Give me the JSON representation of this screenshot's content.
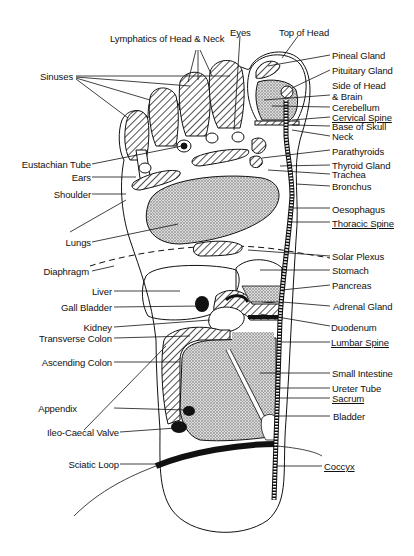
{
  "diagram": {
    "labels_top": [
      {
        "key": "lymphatics",
        "text": "Lymphatics of Head & Neck",
        "x": 110,
        "y": 33
      },
      {
        "key": "eyes",
        "text": "Eyes",
        "x": 230,
        "y": 27
      },
      {
        "key": "top_of_head",
        "text": "Top of Head",
        "x": 279,
        "y": 27
      },
      {
        "key": "sinuses",
        "text": "Sinuses",
        "x": 40,
        "y": 71
      }
    ],
    "labels_left": [
      {
        "key": "eustachian_tube",
        "text": "Eustachian Tube",
        "x": 91,
        "y": 159
      },
      {
        "key": "ears",
        "text": "Ears",
        "x": 91,
        "y": 172
      },
      {
        "key": "shoulder",
        "text": "Shoulder",
        "x": 91,
        "y": 189
      },
      {
        "key": "lungs",
        "text": "Lungs",
        "x": 91,
        "y": 237
      },
      {
        "key": "diaphragm",
        "text": "Diaphragm",
        "x": 89,
        "y": 266
      },
      {
        "key": "liver",
        "text": "Liver",
        "x": 112,
        "y": 286
      },
      {
        "key": "gall_bladder",
        "text": "Gall Bladder",
        "x": 112,
        "y": 302
      },
      {
        "key": "kidney",
        "text": "Kidney",
        "x": 112,
        "y": 322
      },
      {
        "key": "transverse_colon",
        "text": "Transverse Colon",
        "x": 112,
        "y": 333
      },
      {
        "key": "ascending_colon",
        "text": "Ascending Colon",
        "x": 112,
        "y": 357
      },
      {
        "key": "appendix",
        "text": "Appendix",
        "x": 77,
        "y": 404
      },
      {
        "key": "ileo_caecal_valve",
        "text": "Ileo-Caecal Valve",
        "x": 119,
        "y": 428
      },
      {
        "key": "sciatic_loop",
        "text": "Sciatic Loop",
        "x": 119,
        "y": 460
      }
    ],
    "labels_right": [
      {
        "key": "pineal_gland",
        "text": "Pineal Gland",
        "x": 332,
        "y": 50,
        "underline": false
      },
      {
        "key": "pituitary_gland",
        "text": "Pituitary Gland",
        "x": 332,
        "y": 65,
        "underline": false
      },
      {
        "key": "side_of_head",
        "text": "Side of Head",
        "x": 332,
        "y": 80,
        "underline": false
      },
      {
        "key": "and_brain",
        "text": "& Brain",
        "x": 332,
        "y": 91,
        "underline": false
      },
      {
        "key": "cerebellum",
        "text": "Cerebellum",
        "x": 332,
        "y": 102,
        "underline": false
      },
      {
        "key": "cervical_spine",
        "text": "Cervical Spine",
        "x": 332,
        "y": 113,
        "underline": true
      },
      {
        "key": "base_of_skull",
        "text": "Base of Skull",
        "x": 332,
        "y": 122,
        "underline": false
      },
      {
        "key": "neck",
        "text": "Neck",
        "x": 332,
        "y": 131,
        "underline": false
      },
      {
        "key": "parathyroids",
        "text": "Parathyroids",
        "x": 332,
        "y": 147,
        "underline": false
      },
      {
        "key": "thyroid_gland",
        "text": "Thyroid Gland",
        "x": 332,
        "y": 161,
        "underline": false
      },
      {
        "key": "trachea",
        "text": "Trachea",
        "x": 332,
        "y": 170,
        "underline": false
      },
      {
        "key": "bronchus",
        "text": "Bronchus",
        "x": 332,
        "y": 182,
        "underline": false
      },
      {
        "key": "oesophagus",
        "text": "Oesophagus",
        "x": 332,
        "y": 205,
        "underline": false
      },
      {
        "key": "thoracic_spine",
        "text": "Thoracic Spine",
        "x": 332,
        "y": 219,
        "underline": true
      },
      {
        "key": "solar_plexus",
        "text": "Solar Plexus",
        "x": 332,
        "y": 251,
        "underline": false
      },
      {
        "key": "stomach",
        "text": "Stomach",
        "x": 332,
        "y": 266,
        "underline": false
      },
      {
        "key": "pancreas",
        "text": "Pancreas",
        "x": 332,
        "y": 281,
        "underline": false
      },
      {
        "key": "adrenal_gland",
        "text": "Adrenal Gland",
        "x": 332,
        "y": 302,
        "underline": false
      },
      {
        "key": "duodenum",
        "text": "Duodenum",
        "x": 331,
        "y": 323,
        "underline": false
      },
      {
        "key": "lumbar_spine",
        "text": "Lumbar Spine",
        "x": 331,
        "y": 338,
        "underline": true
      },
      {
        "key": "small_intestine",
        "text": "Small Intestine",
        "x": 332,
        "y": 369,
        "underline": false
      },
      {
        "key": "ureter_tube",
        "text": "Ureter Tube",
        "x": 332,
        "y": 384,
        "underline": false
      },
      {
        "key": "sacrum",
        "text": "Sacrum",
        "x": 332,
        "y": 394,
        "underline": true
      },
      {
        "key": "bladder",
        "text": "Bladder",
        "x": 333,
        "y": 412,
        "underline": false
      },
      {
        "key": "coccyx",
        "text": "Coccyx",
        "x": 324,
        "y": 462,
        "underline": true
      }
    ]
  }
}
